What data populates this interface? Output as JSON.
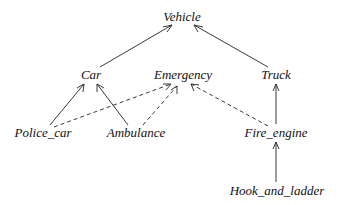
{
  "diagram": {
    "type": "class-hierarchy",
    "nodes": [
      {
        "id": "vehicle",
        "label": "Vehicle",
        "x": 182,
        "y": 21
      },
      {
        "id": "car",
        "label": "Car",
        "x": 91,
        "y": 79
      },
      {
        "id": "emergency",
        "label": "Emergency",
        "x": 183,
        "y": 79
      },
      {
        "id": "truck",
        "label": "Truck",
        "x": 276,
        "y": 79
      },
      {
        "id": "police_car",
        "label": "Police_car",
        "x": 43,
        "y": 137
      },
      {
        "id": "ambulance",
        "label": "Ambulance",
        "x": 136,
        "y": 137
      },
      {
        "id": "fire_engine",
        "label": "Fire_engine",
        "x": 276,
        "y": 137
      },
      {
        "id": "hook_and_ladder",
        "label": "Hook_and_ladder",
        "x": 277,
        "y": 195
      }
    ],
    "edges": [
      {
        "from": "car",
        "to": "vehicle",
        "style": "solid"
      },
      {
        "from": "truck",
        "to": "vehicle",
        "style": "solid"
      },
      {
        "from": "police_car",
        "to": "car",
        "style": "solid"
      },
      {
        "from": "ambulance",
        "to": "car",
        "style": "solid"
      },
      {
        "from": "police_car",
        "to": "emergency",
        "style": "dashed"
      },
      {
        "from": "ambulance",
        "to": "emergency",
        "style": "dashed"
      },
      {
        "from": "fire_engine",
        "to": "emergency",
        "style": "dashed"
      },
      {
        "from": "fire_engine",
        "to": "truck",
        "style": "solid"
      },
      {
        "from": "hook_and_ladder",
        "to": "fire_engine",
        "style": "solid"
      }
    ]
  }
}
